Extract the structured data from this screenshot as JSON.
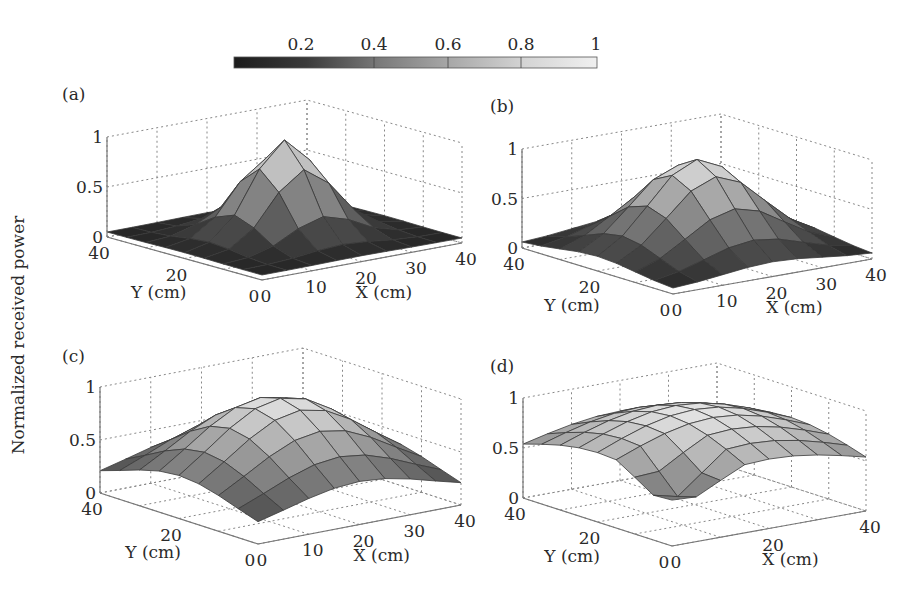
{
  "figure": {
    "ylabel": "Normalized received power",
    "colorbar": {
      "ticks": [
        "0.2",
        "0.4",
        "0.6",
        "0.8",
        "1"
      ],
      "range": [
        0,
        1
      ]
    }
  },
  "chart_data": [
    {
      "type": "surface3d",
      "panel": "(a)",
      "title": "(a)",
      "xlabel": "X (cm)",
      "ylabel": "Y (cm)",
      "zlabel": "Normalized received power",
      "xticks": [
        "0",
        "10",
        "20",
        "30",
        "40"
      ],
      "yticks": [
        "0",
        "20",
        "40"
      ],
      "zticks": [
        "0",
        "0.5",
        "1"
      ],
      "xlim": [
        0,
        40
      ],
      "ylim": [
        0,
        40
      ],
      "zlim": [
        0,
        1
      ],
      "grid_x": [
        0,
        5,
        10,
        15,
        20,
        25,
        30,
        35,
        40
      ],
      "grid_y": [
        0,
        5,
        10,
        15,
        20,
        25,
        30,
        35,
        40
      ],
      "peak": {
        "x": 20,
        "y": 20,
        "z": 1.0
      },
      "shape": "sharp peak",
      "sigma": 6.5,
      "baseline": 0.05
    },
    {
      "type": "surface3d",
      "panel": "(b)",
      "title": "(b)",
      "xlabel": "X (cm)",
      "ylabel": "Y (cm)",
      "xticks": [
        "0",
        "10",
        "20",
        "30",
        "40"
      ],
      "yticks": [
        "0",
        "20",
        "40"
      ],
      "zticks": [
        "0",
        "0.5",
        "1"
      ],
      "xlim": [
        0,
        40
      ],
      "ylim": [
        0,
        40
      ],
      "zlim": [
        0,
        1
      ],
      "peak": {
        "x": 20,
        "y": 20,
        "z": 0.95
      },
      "shape": "moderate peak",
      "sigma": 9.5,
      "baseline": 0.05
    },
    {
      "type": "surface3d",
      "panel": "(c)",
      "title": "(c)",
      "xlabel": "X (cm)",
      "ylabel": "Y (cm)",
      "xticks": [
        "0",
        "10",
        "20",
        "30",
        "40"
      ],
      "yticks": [
        "0",
        "20",
        "40"
      ],
      "zticks": [
        "0",
        "0.5",
        "1"
      ],
      "xlim": [
        0,
        40
      ],
      "ylim": [
        0,
        40
      ],
      "zlim": [
        0,
        1
      ],
      "peak": {
        "x": 20,
        "y": 20,
        "z": 0.95
      },
      "shape": "broad dome",
      "sigma": 14,
      "baseline": 0.1
    },
    {
      "type": "surface3d",
      "panel": "(d)",
      "title": "(d)",
      "xlabel": "X (cm)",
      "ylabel": "Y (cm)",
      "xticks": [
        "0",
        "20",
        "40"
      ],
      "yticks": [
        "0",
        "20",
        "40"
      ],
      "zticks": [
        "0",
        "0.5",
        "1"
      ],
      "xlim": [
        0,
        40
      ],
      "ylim": [
        0,
        40
      ],
      "zlim": [
        0,
        1
      ],
      "peak": {
        "x": 20,
        "y": 20,
        "z": 0.95
      },
      "shape": "very broad dome with dip near origin",
      "sigma": 20,
      "baseline": 0.3
    }
  ]
}
